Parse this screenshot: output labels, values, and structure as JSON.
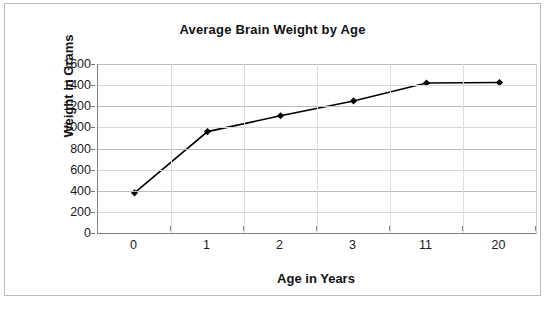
{
  "chart_data": {
    "type": "line",
    "title": "Average Brain Weight by Age",
    "xlabel": "Age in Years",
    "ylabel": "Weight in Grams",
    "categories": [
      "0",
      "1",
      "2",
      "3",
      "11",
      "20"
    ],
    "values": [
      380,
      960,
      1110,
      1250,
      1420,
      1425
    ],
    "series": [
      {
        "name": "Average Brain Weight",
        "values": [
          380,
          960,
          1110,
          1250,
          1420,
          1425
        ]
      }
    ],
    "ylim": [
      0,
      1600
    ],
    "ytick_step": 200,
    "ytick_labels": [
      "1600",
      "1400",
      "1200",
      "1000",
      "800",
      "600",
      "400",
      "200",
      "0"
    ],
    "ytick_values": [
      1600,
      1400,
      1200,
      1000,
      800,
      600,
      400,
      200,
      0
    ],
    "grid": true,
    "grid_axis": "y",
    "legend": false,
    "legend_position": "none",
    "marker": "diamond",
    "line_color": "#000000",
    "marker_color": "#000000",
    "gridline_color": "#d7d7d7",
    "axis_color": "#808080",
    "background_color": "#ffffff",
    "border_color": "#b9b9b9"
  }
}
